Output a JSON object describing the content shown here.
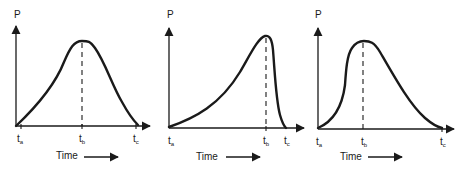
{
  "diagram": {
    "panels": [
      {
        "id": "symmetric-peak",
        "y_label": "P",
        "x_label": "Time",
        "ticks": {
          "a": "t",
          "a_sub": "a",
          "b": "t",
          "b_sub": "b",
          "c": "t",
          "c_sub": "c"
        },
        "shape": "gradual rise, rounded peak at t_b (middle), gradual fall to t_c"
      },
      {
        "id": "late-peak",
        "y_label": "P",
        "x_label": "Time",
        "ticks": {
          "a": "t",
          "a_sub": "a",
          "b": "t",
          "b_sub": "b",
          "c": "t",
          "c_sub": "c"
        },
        "shape": "slow rise to peak at t_b near the end, then steep drop to t_c"
      },
      {
        "id": "early-peak",
        "y_label": "P",
        "x_label": "Time",
        "ticks": {
          "a": "t",
          "a_sub": "a",
          "b": "t",
          "b_sub": "b",
          "c": "t",
          "c_sub": "c"
        },
        "shape": "rapid rise to early peak at t_b, then long gradual decline to t_c"
      }
    ]
  }
}
